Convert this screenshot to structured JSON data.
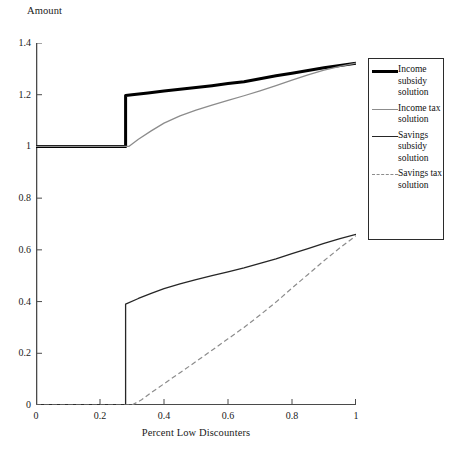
{
  "figure": {
    "title": "",
    "background": "#ffffff"
  },
  "axes": {
    "y_title": "Amount",
    "x_title": "Percent Low Discounters",
    "y_ticks": [
      "0",
      "0.2",
      "0.4",
      "0.6",
      "0.8",
      "1",
      "1.2",
      "1.4"
    ],
    "x_ticks": [
      "0",
      "0.2",
      "0.4",
      "0.6",
      "0.8",
      "1"
    ]
  },
  "legend": {
    "items": [
      {
        "label": "Income subsidy solution",
        "style": "thick-solid-black",
        "color": "#000000"
      },
      {
        "label": "Income tax solution",
        "style": "thin-solid-gray",
        "color": "#8c8c8c"
      },
      {
        "label": "Savings subsidy solution",
        "style": "thin-solid-black",
        "color": "#262626"
      },
      {
        "label": "Savings tax solution",
        "style": "thin-dashed-gray",
        "color": "#8c8c8c"
      }
    ]
  },
  "chart_data": {
    "type": "line",
    "title": "",
    "xlabel": "Percent Low Discounters",
    "ylabel": "Amount",
    "xlim": [
      0,
      1
    ],
    "ylim": [
      0,
      1.4
    ],
    "xticks": [
      0,
      0.2,
      0.4,
      0.6,
      0.8,
      1
    ],
    "yticks": [
      0,
      0.2,
      0.4,
      0.6,
      0.8,
      1,
      1.2,
      1.4
    ],
    "grid": false,
    "legend_position": "right",
    "series": [
      {
        "name": "Income subsidy solution",
        "color": "#000000",
        "linewidth": 3,
        "dash": false,
        "x": [
          0,
          0.05,
          0.1,
          0.15,
          0.2,
          0.25,
          0.28,
          0.28,
          0.3,
          0.35,
          0.4,
          0.45,
          0.5,
          0.55,
          0.6,
          0.65,
          0.7,
          0.75,
          0.8,
          0.85,
          0.9,
          0.95,
          1.0
        ],
        "y": [
          1.0,
          1.0,
          1.0,
          1.0,
          1.0,
          1.0,
          1.0,
          1.197,
          1.2,
          1.207,
          1.214,
          1.221,
          1.228,
          1.235,
          1.243,
          1.25,
          1.262,
          1.273,
          1.283,
          1.294,
          1.304,
          1.313,
          1.322
        ]
      },
      {
        "name": "Income tax solution",
        "color": "#8c8c8c",
        "linewidth": 1.3,
        "dash": false,
        "x": [
          0,
          0.05,
          0.1,
          0.15,
          0.2,
          0.25,
          0.29,
          0.32,
          0.36,
          0.4,
          0.45,
          0.5,
          0.55,
          0.6,
          0.65,
          0.7,
          0.75,
          0.8,
          0.85,
          0.9,
          0.95,
          1.0
        ],
        "y": [
          1.0,
          1.0,
          1.0,
          1.0,
          1.0,
          1.0,
          1.0,
          1.028,
          1.06,
          1.09,
          1.118,
          1.14,
          1.16,
          1.178,
          1.196,
          1.215,
          1.235,
          1.256,
          1.277,
          1.295,
          1.31,
          1.322
        ]
      },
      {
        "name": "Savings subsidy solution",
        "color": "#262626",
        "linewidth": 1.3,
        "dash": false,
        "x": [
          0,
          0.05,
          0.1,
          0.15,
          0.2,
          0.25,
          0.28,
          0.28,
          0.32,
          0.36,
          0.4,
          0.45,
          0.5,
          0.55,
          0.6,
          0.65,
          0.7,
          0.75,
          0.8,
          0.85,
          0.9,
          0.95,
          1.0
        ],
        "y": [
          0,
          0,
          0,
          0,
          0,
          0,
          0,
          0.39,
          0.412,
          0.432,
          0.45,
          0.468,
          0.485,
          0.5,
          0.515,
          0.53,
          0.548,
          0.565,
          0.585,
          0.605,
          0.625,
          0.643,
          0.66
        ]
      },
      {
        "name": "Savings tax solution",
        "color": "#8c8c8c",
        "linewidth": 1.2,
        "dash": true,
        "x": [
          0,
          0.05,
          0.1,
          0.15,
          0.2,
          0.25,
          0.3,
          0.33,
          0.36,
          0.4,
          0.45,
          0.5,
          0.55,
          0.6,
          0.65,
          0.7,
          0.75,
          0.8,
          0.85,
          0.9,
          0.95,
          1.0
        ],
        "y": [
          0,
          0,
          0,
          0,
          0,
          0,
          0,
          0.02,
          0.048,
          0.082,
          0.125,
          0.168,
          0.212,
          0.256,
          0.3,
          0.348,
          0.398,
          0.452,
          0.505,
          0.558,
          0.608,
          0.655
        ]
      }
    ]
  }
}
